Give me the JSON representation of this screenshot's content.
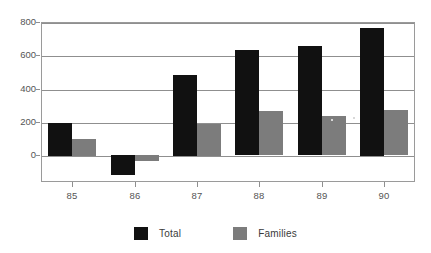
{
  "chart_data": {
    "type": "bar",
    "title": "",
    "subtitle": "",
    "xlabel": "",
    "ylabel": "",
    "categories": [
      "85",
      "86",
      "87",
      "88",
      "89",
      "90"
    ],
    "series": [
      {
        "name": "Total",
        "color": "#111111",
        "values": [
          195,
          -118,
          485,
          630,
          655,
          765
        ]
      },
      {
        "name": "Families",
        "color": "#7c7c7c",
        "values": [
          100,
          -35,
          190,
          265,
          235,
          270
        ]
      }
    ],
    "ylim": [
      -160,
      800
    ],
    "yticks": [
      0,
      200,
      400,
      600,
      800
    ],
    "ytick_labels": [
      "0",
      "200",
      "400",
      "600",
      "800"
    ],
    "xtick_labels": [
      "85",
      "86",
      "87",
      "88",
      "89",
      "90"
    ],
    "grid": true,
    "grid_axis": "y",
    "legend": {
      "position": "bottom-center",
      "entries": [
        {
          "label": "Total",
          "color": "#111111"
        },
        {
          "label": "Families",
          "color": "#7c7c7c"
        }
      ]
    },
    "background_color": "#ffffff",
    "axis_color": "#8f8f8f",
    "text_color": "#555555"
  }
}
